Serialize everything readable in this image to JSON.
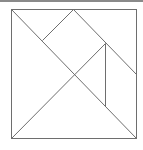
{
  "diagram": {
    "type": "tangram",
    "frame": {
      "x1": 11,
      "y1": 9,
      "x2": 136,
      "y2": 138
    },
    "stroke_color": "#6e6e6e",
    "top_bar_color": "#8a8a8a",
    "segments": [
      {
        "name": "diagonal-main",
        "x1": 11,
        "y1": 9,
        "x2": 136,
        "y2": 138
      },
      {
        "name": "diagonal-left-lower",
        "x1": 11,
        "y1": 138,
        "x2": 105,
        "y2": 43
      },
      {
        "name": "top-apex-left",
        "x1": 73,
        "y1": 9,
        "x2": 42,
        "y2": 40
      },
      {
        "name": "top-apex-right",
        "x1": 73,
        "y1": 9,
        "x2": 136,
        "y2": 74
      },
      {
        "name": "vertical-inner",
        "x1": 105,
        "y1": 43,
        "x2": 105,
        "y2": 106
      }
    ]
  }
}
